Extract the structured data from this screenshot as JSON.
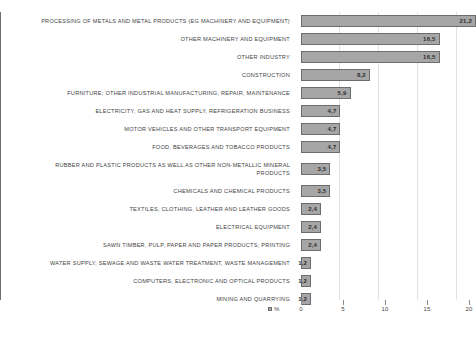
{
  "chart_data": {
    "type": "bar",
    "orientation": "horizontal",
    "title": "",
    "subtitle": "",
    "xlabel": "",
    "ylabel": "",
    "xlim": [
      0,
      20
    ],
    "grid": true,
    "gridlines": [
      5,
      10,
      15,
      20
    ],
    "xticks": [
      "0",
      "5",
      "10",
      "15",
      "20"
    ],
    "xtick_values": [
      0,
      5,
      10,
      15,
      20
    ],
    "legend": {
      "position": "bottom-left",
      "entries": [
        {
          "label": "%",
          "color": "#a6a6a6",
          "marker": "square"
        }
      ]
    },
    "value_labels_inside_bars": true,
    "decimal_separator": ",",
    "bar_color": "#a6a6a6",
    "bar_border_color": "#6d6d6d",
    "categories": [
      "PROCESSING OF METALS AND METAL PRODUCTS (EG MACHINERY AND EQUIPMENT)",
      "OTHER MACHINERY AND EQUIPMENT",
      "OTHER INDUSTRY",
      "CONSTRUCTION",
      "FURNITURE; OTHER INDUSTRIAL MANUFACTURING; REPAIR, MAINTENANCE",
      "ELECTRICITY, GAS AND HEAT SUPPLY, REFRIGERATION BUSINESS",
      "MOTOR VEHICLES AND OTHER TRANSPORT EQUIPMENT",
      "FOOD, BEVERAGES AND TOBACCO PRODUCTS",
      "RUBBER AND PLASTIC PRODUCTS AS WELL AS OTHER NON-METALLIC MINERAL\nPRODUCTS",
      "CHEMICALS AND CHEMICAL PRODUCTS",
      "TEXTILES, CLOTHING, LEATHER AND LEATHER GOODS",
      "ELECTRICAL EQUIPMENT",
      "SAWN TIMBER, PULP, PAPER AND PAPER PRODUCTS; PRINTING",
      "WATER SUPPLY, SEWAGE AND WASTE WATER TREATMENT, WASTE MANAGEMENT",
      "COMPUTERS, ELECTRONIC AND OPTICAL PRODUCTS",
      "MINING AND QUARRYING"
    ],
    "values": [
      21.2,
      16.5,
      16.5,
      8.2,
      5.9,
      4.7,
      4.7,
      4.7,
      3.5,
      3.5,
      2.4,
      2.4,
      2.4,
      1.2,
      1.2,
      1.2
    ],
    "value_labels": [
      "21,2",
      "16,5",
      "16,5",
      "8,2",
      "5,9",
      "4,7",
      "4,7",
      "4,7",
      "3,5",
      "3,5",
      "2,4",
      "2,4",
      "2,4",
      "1,2",
      "1,2",
      "1,2"
    ]
  }
}
